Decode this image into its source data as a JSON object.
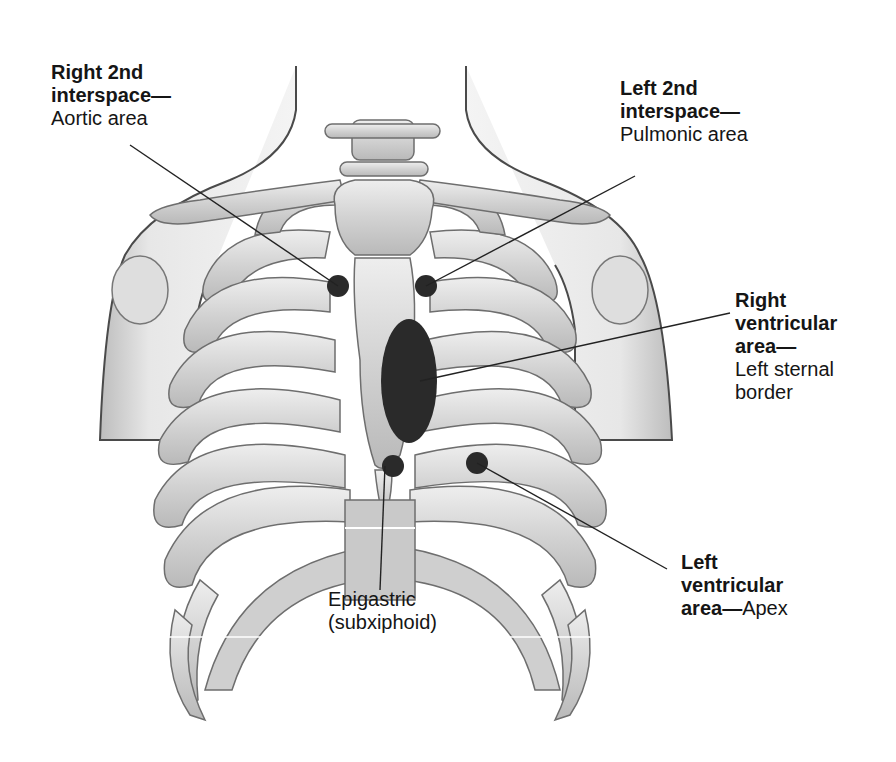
{
  "figure": {
    "colors": {
      "bone_fill": "#cfcfcf",
      "bone_light": "#e6e6e6",
      "bone_stroke": "#6e6e6e",
      "skin_stroke": "#5a5a5a",
      "marker": "#2a2a2a",
      "leader_line": "#222222"
    }
  },
  "labels": {
    "aortic": {
      "title_line1": "Right 2nd",
      "title_line2": "interspace—",
      "desc": "Aortic area"
    },
    "pulmonic": {
      "title_line1": "Left 2nd",
      "title_line2": "interspace—",
      "desc": "Pulmonic area"
    },
    "right_ventricular": {
      "title_line1": "Right",
      "title_line2": "ventricular",
      "title_line3": "area—",
      "desc_line1": "Left sternal",
      "desc_line2": "border"
    },
    "left_ventricular": {
      "title_line1": "Left",
      "title_line2": "ventricular",
      "title_line3": "area—",
      "desc": "Apex"
    },
    "epigastric": {
      "line1": "Epigastric",
      "line2": "(subxiphoid)"
    }
  }
}
